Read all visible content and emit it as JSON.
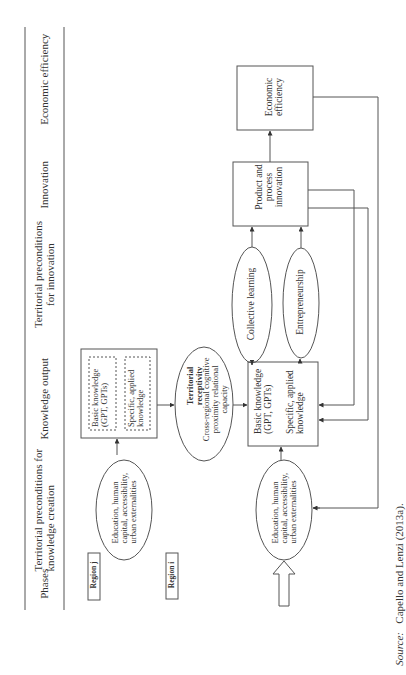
{
  "header": {
    "phases_label": "Phases",
    "columns": [
      {
        "id": "economic-efficiency",
        "label": "Economic efficiency"
      },
      {
        "id": "innovation",
        "label": "Innovation"
      },
      {
        "id": "territorial-preconditions-innovation",
        "label": "Territorial preconditions for innovation"
      },
      {
        "id": "knowledge-output",
        "label": "Knowledge output"
      },
      {
        "id": "territorial-preconditions-knowledge-creation",
        "label": "Territorial preconditions for knowledge creation"
      }
    ]
  },
  "regions": {
    "region_j": "Region j",
    "region_i": "Region i"
  },
  "nodes": {
    "economic_efficiency": "Economic efficiency",
    "product_process_innovation": "Product and process innovation",
    "collective_learning": "Collective learning",
    "entrepreneurship": "Entrepreneurship",
    "knowledge_i_basic": "Basic knowledge (GPT, GPTs)",
    "knowledge_i_specific": "Specific, applied knowledge",
    "knowledge_j_basic": "Basic knowledge (GPT, GPTs)",
    "knowledge_j_specific": "Specific, applied knowledge",
    "territorial_receptivity_title": "Territorial receptivity",
    "territorial_receptivity_body": "Cross-regional cognitive proximity relational capacity",
    "preconditions_j": "Education, human capital, accessibility, urban externalities",
    "preconditions_i": "Education, human capital, accessibility, urban externalities"
  },
  "source": {
    "label": "Source:",
    "text": "Capello and Lenzi (2013a)."
  },
  "colors": {
    "line": "#555555",
    "text": "#333333"
  }
}
